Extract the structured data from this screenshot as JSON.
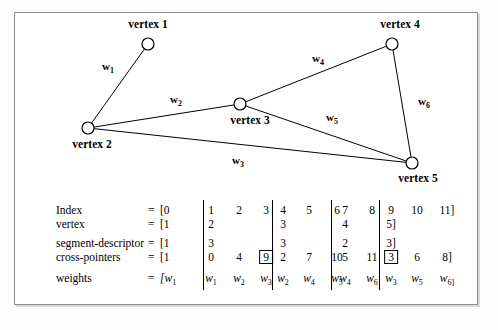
{
  "figure": {
    "graph": {
      "nodes": [
        {
          "id": "v1",
          "label": "vertex 1",
          "cx": 148,
          "cy": 44,
          "label_x": 148,
          "label_y": 18
        },
        {
          "id": "v2",
          "label": "vertex 2",
          "cx": 88,
          "cy": 128,
          "label_x": 92,
          "label_y": 138
        },
        {
          "id": "v3",
          "label": "vertex 3",
          "cx": 240,
          "cy": 104,
          "label_x": 250,
          "label_y": 114
        },
        {
          "id": "v4",
          "label": "vertex 4",
          "cx": 392,
          "cy": 44,
          "label_x": 400,
          "label_y": 18
        },
        {
          "id": "v5",
          "label": "vertex 5",
          "cx": 412,
          "cy": 163,
          "label_x": 418,
          "label_y": 172
        }
      ],
      "edges": [
        {
          "id": "e1",
          "from": "v2",
          "to": "v1",
          "weight": "w",
          "weight_sub": "1",
          "label_x": 108,
          "label_y": 60
        },
        {
          "id": "e2",
          "from": "v2",
          "to": "v3",
          "weight": "w",
          "weight_sub": "2",
          "label_x": 176,
          "label_y": 93
        },
        {
          "id": "e3",
          "from": "v2",
          "to": "v5",
          "weight": "w",
          "weight_sub": "3",
          "label_x": 238,
          "label_y": 154
        },
        {
          "id": "e4",
          "from": "v3",
          "to": "v4",
          "weight": "w",
          "weight_sub": "4",
          "label_x": 318,
          "label_y": 52
        },
        {
          "id": "e5",
          "from": "v3",
          "to": "v5",
          "weight": "w",
          "weight_sub": "5",
          "label_x": 332,
          "label_y": 111
        },
        {
          "id": "e6",
          "from": "v4",
          "to": "v5",
          "weight": "w",
          "weight_sub": "6",
          "label_x": 424,
          "label_y": 95
        }
      ]
    },
    "table": {
      "equals": "=",
      "rows": [
        {
          "name": "index-row",
          "label": "Index",
          "open": "[0",
          "groups": [
            [
              "1",
              "2",
              "3"
            ],
            [
              "4",
              "5",
              "6"
            ],
            [
              "7",
              "8"
            ],
            [
              "9",
              "10",
              "11]"
            ]
          ]
        },
        {
          "name": "vertex-row",
          "label": "vertex",
          "open": "[1",
          "groups": [
            [
              "2",
              "",
              ""
            ],
            [
              "3",
              "",
              ""
            ],
            [
              "4",
              ""
            ],
            [
              "5]",
              "",
              ""
            ]
          ]
        },
        {
          "name": "segment-descriptor-row",
          "label": "segment-descriptor",
          "open": "[1",
          "groups": [
            [
              "3",
              "",
              ""
            ],
            [
              "3",
              "",
              ""
            ],
            [
              "2",
              ""
            ],
            [
              "3]",
              "",
              ""
            ]
          ]
        },
        {
          "name": "cross-pointers-row",
          "label": "cross-pointers",
          "open": "[1",
          "groups": [
            [
              "0",
              "4",
              "9"
            ],
            [
              "2",
              "7",
              "10"
            ],
            [
              "5",
              "11"
            ],
            [
              "3",
              "6",
              "8]"
            ]
          ],
          "boxed": [
            "0-2",
            "3-0"
          ]
        },
        {
          "name": "weights-row",
          "label": "weights",
          "open": "[w",
          "open_sub": "1",
          "italic": true,
          "groups": [
            [
              [
                "w",
                "1"
              ],
              [
                "w",
                "2"
              ],
              [
                "w",
                "3"
              ]
            ],
            [
              [
                "w",
                "2"
              ],
              [
                "w",
                "4"
              ],
              [
                "w",
                "5"
              ]
            ],
            [
              [
                "w",
                "4"
              ],
              [
                "w",
                "6"
              ]
            ],
            [
              [
                "w",
                "3"
              ],
              [
                "w",
                "5"
              ],
              [
                "w",
                "6]"
              ]
            ]
          ]
        }
      ]
    }
  },
  "colors": {
    "frame_border": "#8c8c8c",
    "ink": "#000000",
    "page_bg": "#fdfdfd",
    "panel_bg": "#ffffff"
  }
}
